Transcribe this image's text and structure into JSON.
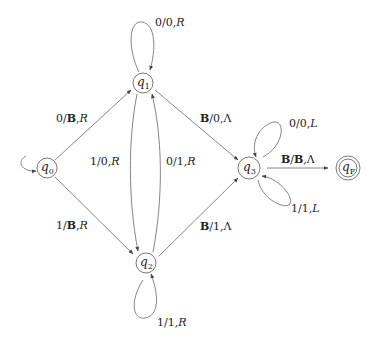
{
  "diagram": {
    "type": "turing-machine-state-diagram",
    "states": [
      {
        "id": "q0",
        "label": "q",
        "sub": "0",
        "x": 47,
        "y": 168,
        "start": true,
        "accepting": false
      },
      {
        "id": "q1",
        "label": "q",
        "sub": "1",
        "x": 143,
        "y": 83,
        "start": false,
        "accepting": false
      },
      {
        "id": "q2",
        "label": "q",
        "sub": "2",
        "x": 146,
        "y": 263,
        "start": false,
        "accepting": false
      },
      {
        "id": "q3",
        "label": "q",
        "sub": "3",
        "x": 249,
        "y": 168,
        "start": false,
        "accepting": false
      },
      {
        "id": "qF",
        "label": "q",
        "sub": "F",
        "x": 348,
        "y": 168,
        "start": false,
        "accepting": true
      }
    ],
    "transitions": [
      {
        "from": "q0",
        "to": "q1",
        "read": "0",
        "write": "B",
        "move": "R",
        "label": "0/B,R"
      },
      {
        "from": "q0",
        "to": "q2",
        "read": "1",
        "write": "B",
        "move": "R",
        "label": "1/B,R"
      },
      {
        "from": "q1",
        "to": "q1",
        "read": "0",
        "write": "0",
        "move": "R",
        "label": "0/0,R"
      },
      {
        "from": "q1",
        "to": "q2",
        "read": "1",
        "write": "0",
        "move": "R",
        "label": "1/0,R"
      },
      {
        "from": "q2",
        "to": "q1",
        "read": "0",
        "write": "1",
        "move": "R",
        "label": "0/1,R"
      },
      {
        "from": "q2",
        "to": "q2",
        "read": "1",
        "write": "1",
        "move": "R",
        "label": "1/1,R"
      },
      {
        "from": "q1",
        "to": "q3",
        "read": "B",
        "write": "0",
        "move": "Λ",
        "label": "B/0,Λ"
      },
      {
        "from": "q2",
        "to": "q3",
        "read": "B",
        "write": "1",
        "move": "Λ",
        "label": "B/1,Λ"
      },
      {
        "from": "q3",
        "to": "q3",
        "read": "0",
        "write": "0",
        "move": "L",
        "label": "0/0,L"
      },
      {
        "from": "q3",
        "to": "q3",
        "read": "1",
        "write": "1",
        "move": "L",
        "label": "1/1,L"
      },
      {
        "from": "q3",
        "to": "qF",
        "read": "B",
        "write": "B",
        "move": "Λ",
        "label": "B/B,Λ"
      }
    ]
  },
  "labels": {
    "q0": {
      "main": "q",
      "sub": "0"
    },
    "q1": {
      "main": "q",
      "sub": "1"
    },
    "q2": {
      "main": "q",
      "sub": "2"
    },
    "q3": {
      "main": "q",
      "sub": "3"
    },
    "qF": {
      "main": "q",
      "sub": "F"
    },
    "t_q0_q1": {
      "a": "0/",
      "b": "B",
      "c": ",",
      "d": "R"
    },
    "t_q0_q2": {
      "a": "1/",
      "b": "B",
      "c": ",",
      "d": "R"
    },
    "t_q1_q1": {
      "a": "0/0,",
      "d": "R"
    },
    "t_q1_q2": {
      "a": "1/0,",
      "d": "R"
    },
    "t_q2_q1": {
      "a": "0/1,",
      "d": "R"
    },
    "t_q2_q2": {
      "a": "1/1,",
      "d": "R"
    },
    "t_q1_q3": {
      "b": "B",
      "a": "/0,",
      "d": "Λ"
    },
    "t_q2_q3": {
      "b": "B",
      "a": "/1,",
      "d": "Λ"
    },
    "t_q3_q3_top": {
      "a": "0/0,",
      "d": "L"
    },
    "t_q3_q3_bot": {
      "a": "1/1,",
      "d": "L"
    },
    "t_q3_qF": {
      "b": "B",
      "a": "/",
      "b2": "B",
      "c": ",",
      "d": "Λ"
    }
  },
  "colors": {
    "stroke": "#666666",
    "text": "#222222",
    "background": "#ffffff"
  }
}
